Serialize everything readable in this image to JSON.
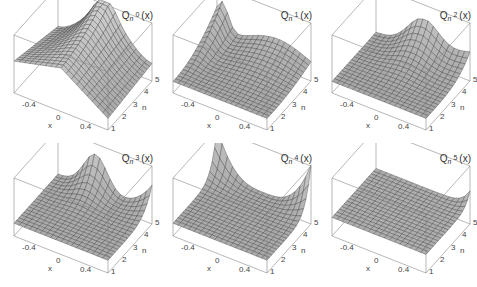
{
  "figure": {
    "layout": {
      "rows": 2,
      "cols": 3
    },
    "colors": {
      "surface": "#a9a9a9",
      "surface_light": "#c9c9c9",
      "mesh": "#333333",
      "box": "#888888",
      "text": "#333333"
    }
  },
  "panels": [
    {
      "title_main": "Q",
      "title_sub": "n",
      "title_sup": "0",
      "title_arg": "(x)",
      "x_ticks": [
        "-0.4",
        "0",
        "0.4"
      ],
      "x_label": "x",
      "n_ticks": [
        "1",
        "2",
        "3",
        "4",
        "5"
      ],
      "n_label": "n"
    },
    {
      "title_main": "Q",
      "title_sub": "n",
      "title_sup": "1",
      "title_arg": "(x)",
      "x_ticks": [
        "-0.4",
        "0",
        "0.4"
      ],
      "x_label": "x",
      "n_ticks": [
        "1",
        "2",
        "3",
        "4",
        "5"
      ],
      "n_label": "n"
    },
    {
      "title_main": "Q",
      "title_sub": "n",
      "title_sup": "2",
      "title_arg": "(x)",
      "x_ticks": [
        "-0.4",
        "0",
        "0.4"
      ],
      "x_label": "x",
      "n_ticks": [
        "1",
        "2",
        "3",
        "4",
        "5"
      ],
      "n_label": "n"
    },
    {
      "title_main": "Q",
      "title_sub": "n",
      "title_sup": "3",
      "title_arg": "(x)",
      "x_ticks": [
        "-0.4",
        "0",
        "0.4"
      ],
      "x_label": "x",
      "n_ticks": [
        "1",
        "2",
        "3",
        "4",
        "5"
      ],
      "n_label": "n"
    },
    {
      "title_main": "Q",
      "title_sub": "n",
      "title_sup": "4",
      "title_arg": "(x)",
      "x_ticks": [
        "-0.4",
        "0",
        "0.4"
      ],
      "x_label": "x",
      "n_ticks": [
        "1",
        "2",
        "3",
        "4",
        "5"
      ],
      "n_label": "n"
    },
    {
      "title_main": "Q",
      "title_sub": "n",
      "title_sup": "5",
      "title_arg": "(x)",
      "x_ticks": [
        "-0.4",
        "0",
        "0.4"
      ],
      "x_label": "x",
      "n_ticks": [
        "1",
        "2",
        "3",
        "4",
        "5"
      ],
      "n_label": "n"
    }
  ],
  "chart_data": [
    {
      "type": "surface3d",
      "title": "Q_n^0(x)",
      "xlabel": "x",
      "ylabel": "n",
      "xlim": [
        -0.5,
        0.5
      ],
      "ylim": [
        1,
        5
      ],
      "x_ticks": [
        -0.4,
        0,
        0.4
      ],
      "y_ticks": [
        1,
        2,
        3,
        4,
        5
      ],
      "shape": "saddle-like: high along near and left edges, peak near x≈0 at high n, dips at near corner (x=0.5,n=1)",
      "k": 0
    },
    {
      "type": "surface3d",
      "title": "Q_n^1(x)",
      "xlabel": "x",
      "ylabel": "n",
      "xlim": [
        -0.5,
        0.5
      ],
      "ylim": [
        1,
        5
      ],
      "x_ticks": [
        -0.4,
        0,
        0.4
      ],
      "y_ticks": [
        1,
        2,
        3,
        4,
        5
      ],
      "shape": "sharp peak at back-left corner (x=-0.5,n=5), raised ridge at back, low at front-right",
      "k": 1
    },
    {
      "type": "surface3d",
      "title": "Q_n^2(x)",
      "xlabel": "x",
      "ylabel": "n",
      "xlim": [
        -0.5,
        0.5
      ],
      "ylim": [
        1,
        5
      ],
      "x_ticks": [
        -0.4,
        0,
        0.4
      ],
      "y_ticks": [
        1,
        2,
        3,
        4,
        5
      ],
      "shape": "flat near n=1..2, hump near x≈0 at high n, rise toward x=0.5 at n=5",
      "k": 2
    },
    {
      "type": "surface3d",
      "title": "Q_n^3(x)",
      "xlabel": "x",
      "ylabel": "n",
      "xlim": [
        -0.5,
        0.5
      ],
      "ylim": [
        1,
        5
      ],
      "x_ticks": [
        -0.4,
        0,
        0.4
      ],
      "y_ticks": [
        1,
        2,
        3,
        4,
        5
      ],
      "shape": "flat for n<=3, peak at x≈-0.2..0 for n=5 and rising at x=0.5, n=5",
      "k": 3
    },
    {
      "type": "surface3d",
      "title": "Q_n^4(x)",
      "xlabel": "x",
      "ylabel": "n",
      "xlim": [
        -0.5,
        0.5
      ],
      "ylim": [
        1,
        5
      ],
      "x_ticks": [
        -0.4,
        0,
        0.4
      ],
      "y_ticks": [
        1,
        2,
        3,
        4,
        5
      ],
      "shape": "flat for n<=4, U-shaped rise at both x edges at n=5",
      "k": 4
    },
    {
      "type": "surface3d",
      "title": "Q_n^5(x)",
      "xlabel": "x",
      "ylabel": "n",
      "xlim": [
        -0.5,
        0.5
      ],
      "ylim": [
        1,
        5
      ],
      "x_ticks": [
        -0.4,
        0,
        0.4
      ],
      "y_ticks": [
        1,
        2,
        3,
        4,
        5
      ],
      "shape": "nearly flat everywhere, slight rise at x=0.5, n=5",
      "k": 5
    }
  ]
}
